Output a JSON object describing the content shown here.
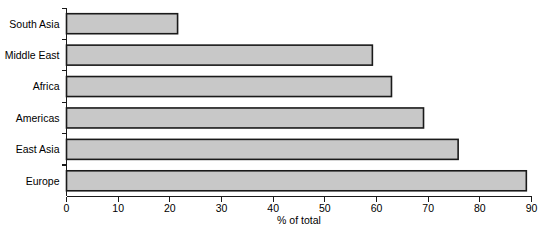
{
  "chart_data": {
    "type": "bar",
    "orientation": "horizontal",
    "title": "",
    "subtitle": "",
    "xlabel": "% of total",
    "ylabel": "",
    "categories": [
      "South Asia",
      "Middle East",
      "Africa",
      "Americas",
      "East Asia",
      "Europe"
    ],
    "values": [
      21.5,
      59.2,
      62.9,
      69.1,
      75.8,
      89.0
    ],
    "series": [
      {
        "name": "% of total",
        "values": [
          21.5,
          59.2,
          62.9,
          69.1,
          75.8,
          89.0
        ]
      }
    ],
    "xlim": [
      0,
      90
    ],
    "xticks": [
      0,
      10,
      20,
      30,
      40,
      50,
      60,
      70,
      80,
      90
    ],
    "xtick_labels": [
      "0",
      "10",
      "20",
      "30",
      "40",
      "50",
      "60",
      "70",
      "80",
      "90"
    ],
    "grid": false,
    "legend": false,
    "legend_position": "none",
    "bar_fill_color": "#c8c8c8",
    "bar_border_color": "#1a1a1a",
    "axis_color": "#1a1a1a",
    "background_color": "#ffffff"
  }
}
